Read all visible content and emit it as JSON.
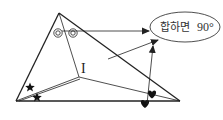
{
  "diagram": {
    "title": "",
    "incenter_label": "I",
    "ellipse_label_korean": "합하면",
    "ellipse_label_value": "90°",
    "markers": {
      "apex_angle_marks": "double-circle",
      "left_angle_marks": "star",
      "right_angle_marks": "heart"
    },
    "colors": {
      "stroke": "#222222",
      "background": "#ffffff"
    }
  }
}
